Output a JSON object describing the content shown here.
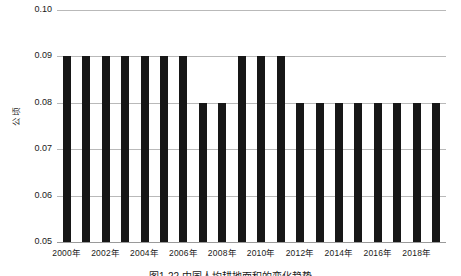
{
  "chart_data": {
    "type": "bar",
    "title": "",
    "xlabel": "",
    "ylabel": "公顷",
    "ylim": [
      0.05,
      0.1
    ],
    "ytick_values": [
      0.1,
      0.09,
      0.08,
      0.07,
      0.06,
      0.05
    ],
    "ytick_labels": [
      "0.10",
      "0.09",
      "0.08",
      "0.07",
      "0.06",
      "0.05"
    ],
    "grid": true,
    "legend": "none",
    "categories": [
      "2000年",
      "2001年",
      "2002年",
      "2003年",
      "2004年",
      "2005年",
      "2006年",
      "2007年",
      "2008年",
      "2009年",
      "2010年",
      "2011年",
      "2012年",
      "2013年",
      "2014年",
      "2015年",
      "2016年",
      "2017年",
      "2018年",
      "2019年"
    ],
    "xtick_labels": [
      "2000年",
      "2002年",
      "2004年",
      "2006年",
      "2008年",
      "2010年",
      "2012年",
      "2014年",
      "2016年",
      "2018年"
    ],
    "values": [
      0.09,
      0.09,
      0.09,
      0.09,
      0.09,
      0.09,
      0.09,
      0.08,
      0.08,
      0.09,
      0.09,
      0.09,
      0.08,
      0.08,
      0.08,
      0.08,
      0.08,
      0.08,
      0.08,
      0.08
    ],
    "bar_color": "#171717",
    "gridline_color": "#b9b9b9"
  },
  "caption": {
    "text": "图1-22 中国人均耕地面积的变化趋势"
  }
}
